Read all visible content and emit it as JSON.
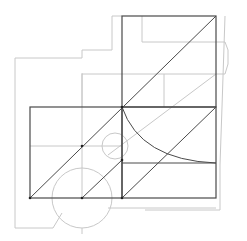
{
  "diagram": {
    "title": "",
    "width": 247,
    "height": 241,
    "colors": {
      "background": "#ffffff",
      "dark_stroke": "#4a4a4a",
      "light_stroke": "#c8c8c8"
    },
    "outline_light": [
      {
        "name": "outer-floor-outline",
        "points": "15,58 82,58 82,50 112,50 112,16 122,16"
      },
      {
        "name": "outer-left-side",
        "points": "15,58 15,228 53,228 62,213"
      },
      {
        "name": "inner-left-block",
        "points": "82,73 82,107"
      },
      {
        "name": "top-inner-rect",
        "points": "142,16 142,42 216,42"
      },
      {
        "name": "right-bump",
        "points": "216,42 225,42 228,50 228,64 225,74 216,74"
      },
      {
        "name": "right-outer-side",
        "points": "225,16 222,107 220,165 220,210 216,210 145,210"
      },
      {
        "name": "bottom-base-line",
        "points": "108,208 216,208"
      }
    ],
    "rects_dark": [
      {
        "name": "top-square",
        "x": 122,
        "y": 16,
        "w": 94,
        "h": 91
      },
      {
        "name": "left-rectangle",
        "x": 30,
        "y": 107,
        "w": 92,
        "h": 91
      },
      {
        "name": "bottom-right-square",
        "x": 122,
        "y": 107,
        "w": 94,
        "h": 91
      }
    ],
    "lines_dark": [
      {
        "name": "main-diagonal",
        "x1": 30,
        "y1": 198,
        "x2": 216,
        "y2": 16
      },
      {
        "name": "lower-diagonal",
        "x1": 122,
        "y1": 198,
        "x2": 216,
        "y2": 107
      },
      {
        "name": "left-mid-diagonal",
        "x1": 82,
        "y1": 198,
        "x2": 122,
        "y2": 160
      },
      {
        "name": "lower-right-hline",
        "x1": 122,
        "y1": 163,
        "x2": 216,
        "y2": 163
      }
    ],
    "lines_light": [
      {
        "name": "top-mid-hline",
        "x1": 82,
        "y1": 74,
        "x2": 216,
        "y2": 74
      },
      {
        "name": "left-mid-hline",
        "x1": 30,
        "y1": 146,
        "x2": 122,
        "y2": 146
      },
      {
        "name": "left-vline",
        "x1": 82,
        "y1": 74,
        "x2": 82,
        "y2": 198
      },
      {
        "name": "inner-vline",
        "x1": 164,
        "y1": 74,
        "x2": 164,
        "y2": 107
      },
      {
        "name": "light-diagonal",
        "x1": 108,
        "y1": 155,
        "x2": 216,
        "y2": 74
      },
      {
        "name": "base-tick",
        "x1": 82,
        "y1": 228,
        "x2": 82,
        "y2": 234
      }
    ],
    "circles_light": [
      {
        "name": "small-circle",
        "cx": 115,
        "cy": 146,
        "r": 13
      },
      {
        "name": "large-circle",
        "cx": 82,
        "cy": 198,
        "r": 30
      }
    ],
    "arcs_dark": [
      {
        "name": "quarter-arc",
        "d": "M122,107 Q140,160 216,163"
      }
    ],
    "points": [
      {
        "name": "node-center",
        "cx": 122,
        "cy": 107
      },
      {
        "name": "node-left-bottom",
        "cx": 30,
        "cy": 198
      },
      {
        "name": "node-mid-bottom",
        "cx": 82,
        "cy": 198
      },
      {
        "name": "node-right-bottom",
        "cx": 122,
        "cy": 198
      },
      {
        "name": "node-mid-left",
        "cx": 82,
        "cy": 146
      },
      {
        "name": "node-small-circle-bottom",
        "cx": 122,
        "cy": 160
      }
    ]
  }
}
